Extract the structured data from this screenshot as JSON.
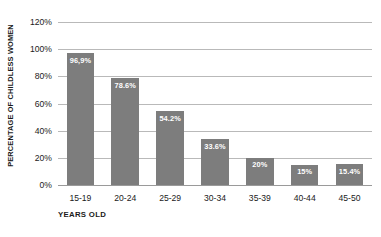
{
  "chart_data": {
    "type": "bar",
    "title": "",
    "subtitle": "",
    "xlabel": "YEARS OLD",
    "ylabel": "PERCENTAGE OF CHILDLESS WOMEN",
    "categories": [
      "15-19",
      "20-24",
      "25-29",
      "30-34",
      "35-39",
      "40-44",
      "45-50"
    ],
    "values": [
      96.9,
      78.6,
      54.2,
      33.6,
      20,
      15,
      15.4
    ],
    "value_labels": [
      "96,9%",
      "78.6%",
      "54.2%",
      "33.6%",
      "20%",
      "15%",
      "15.4%"
    ],
    "ylim": [
      0,
      120
    ],
    "ytick_labels": [
      "0%",
      "20%",
      "40%",
      "60%",
      "80%",
      "100%",
      "120%"
    ],
    "ytick_values": [
      0,
      20,
      40,
      60,
      80,
      100,
      120
    ],
    "grid": true,
    "legend": "none",
    "bar_color": "#7d7d7d",
    "grid_color": "#b9b9b9",
    "label_color": "#ffffff",
    "background": "#ffffff"
  }
}
